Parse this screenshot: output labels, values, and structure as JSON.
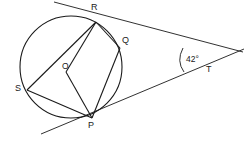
{
  "figure": {
    "type": "circle-geometry-diagram",
    "background_color": "#ffffff",
    "stroke_color": "#1a1a1a",
    "label_color": "#1a1a1a",
    "circle": {
      "center_label": "O",
      "center": {
        "x": 71,
        "y": 67
      },
      "radius": 51
    },
    "points": [
      {
        "name": "R",
        "label": "R",
        "x": 96,
        "y": 22,
        "label_x": 91,
        "label_y": 5
      },
      {
        "name": "Q",
        "label": "Q",
        "x": 120,
        "y": 48,
        "label_x": 122,
        "label_y": 38
      },
      {
        "name": "P",
        "label": "P",
        "x": 92,
        "y": 118,
        "label_x": 88,
        "label_y": 122
      },
      {
        "name": "S",
        "label": "S",
        "x": 27,
        "y": 90,
        "label_x": 16,
        "label_y": 86
      },
      {
        "name": "T",
        "label": "T",
        "x": 216,
        "y": 61,
        "label_x": 205,
        "label_y": 67
      },
      {
        "name": "O",
        "label": "O",
        "x": 71,
        "y": 67,
        "label_x": 62,
        "label_y": 63
      }
    ],
    "chords": [
      {
        "name": "chord-R-S",
        "from": "R",
        "to": "S"
      },
      {
        "name": "chord-R-O-P",
        "from": "R",
        "to": "P",
        "via": "O"
      },
      {
        "name": "chord-R-Q",
        "from": "R",
        "to": "Q"
      },
      {
        "name": "chord-Q-P",
        "from": "Q",
        "to": "P"
      },
      {
        "name": "chord-S-P",
        "from": "S",
        "to": "P"
      }
    ],
    "tangents": [
      {
        "name": "tangent-at-R",
        "touch_point": "R",
        "through": "T"
      },
      {
        "name": "tangent-at-P",
        "touch_point": "P",
        "through": "T"
      }
    ],
    "angle": {
      "label": "42°",
      "value": 42,
      "unit": "degrees",
      "vertex": "T",
      "label_x": 182,
      "label_y": 57
    }
  }
}
